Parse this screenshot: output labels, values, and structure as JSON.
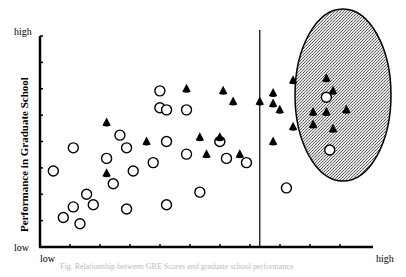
{
  "chart_data": {
    "type": "scatter",
    "title": "",
    "xlabel": "GRE Scores",
    "ylabel": "Performance in Graduate School",
    "x_ticks": {
      "low": "low",
      "high": "high"
    },
    "y_ticks": {
      "low": "low",
      "high": "high"
    },
    "xlim": [
      0,
      10
    ],
    "ylim": [
      0,
      10
    ],
    "grid": false,
    "cutoff_line_x": 6.6,
    "highlight_region": {
      "shape": "ellipse",
      "cx": 8.2,
      "cy": 6.8,
      "rx": 1.75,
      "ry": 3.6,
      "fill": "stippled gray"
    },
    "series": [
      {
        "name": "circles",
        "marker": "open-circle",
        "points": [
          [
            0.7,
            1.4
          ],
          [
            1.0,
            1.9
          ],
          [
            1.4,
            2.5
          ],
          [
            0.4,
            3.6
          ],
          [
            1.6,
            2.0
          ],
          [
            1.2,
            1.1
          ],
          [
            1.0,
            4.7
          ],
          [
            2.0,
            4.2
          ],
          [
            2.4,
            5.3
          ],
          [
            2.6,
            4.7
          ],
          [
            2.8,
            3.6
          ],
          [
            2.2,
            3.0
          ],
          [
            2.6,
            1.8
          ],
          [
            3.8,
            2.0
          ],
          [
            3.8,
            5.0
          ],
          [
            3.6,
            6.6
          ],
          [
            4.4,
            4.4
          ],
          [
            3.4,
            4.0
          ],
          [
            3.8,
            6.5
          ],
          [
            4.4,
            6.5
          ],
          [
            3.6,
            7.4
          ],
          [
            5.4,
            5.0
          ],
          [
            5.6,
            4.2
          ],
          [
            4.8,
            2.6
          ],
          [
            6.2,
            4.0
          ],
          [
            8.6,
            7.1
          ],
          [
            8.7,
            4.6
          ],
          [
            7.4,
            2.8
          ]
        ]
      },
      {
        "name": "triangles",
        "marker": "filled-triangle",
        "points": [
          [
            2.0,
            3.5
          ],
          [
            2.0,
            5.9
          ],
          [
            3.2,
            5.0
          ],
          [
            4.4,
            7.5
          ],
          [
            4.8,
            5.2
          ],
          [
            5.0,
            4.4
          ],
          [
            5.4,
            5.2
          ],
          [
            5.5,
            7.4
          ],
          [
            5.8,
            6.9
          ],
          [
            6.0,
            4.4
          ],
          [
            6.6,
            6.9
          ],
          [
            7.0,
            7.3
          ],
          [
            7.6,
            7.9
          ],
          [
            8.8,
            7.4
          ],
          [
            7.2,
            6.5
          ],
          [
            7.6,
            5.7
          ],
          [
            8.2,
            6.4
          ],
          [
            9.2,
            6.5
          ],
          [
            7.0,
            6.8
          ],
          [
            8.6,
            6.4
          ],
          [
            8.2,
            5.8
          ],
          [
            7.0,
            5.0
          ],
          [
            8.6,
            8.0
          ],
          [
            8.8,
            5.6
          ]
        ]
      }
    ]
  },
  "labels": {
    "y_high": "high",
    "y_low": "low",
    "x_low": "low",
    "x_high": "high",
    "y_axis_title": "Performance in Graduate School",
    "caption": "Fig. Relationship between GRE Scores and graduate school performance"
  }
}
